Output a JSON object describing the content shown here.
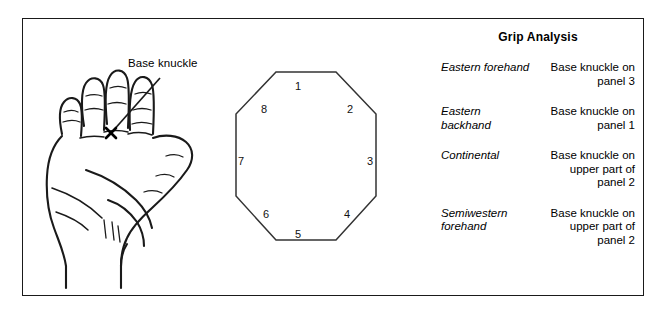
{
  "figure": {
    "hand": {
      "annotation_label": "Base knuckle",
      "marker": "x-marker"
    },
    "octagon": {
      "panels": [
        {
          "number": "1",
          "position": "top"
        },
        {
          "number": "2",
          "position": "top-right"
        },
        {
          "number": "3",
          "position": "right"
        },
        {
          "number": "4",
          "position": "bottom-right"
        },
        {
          "number": "5",
          "position": "bottom"
        },
        {
          "number": "6",
          "position": "bottom-left"
        },
        {
          "number": "7",
          "position": "left"
        },
        {
          "number": "8",
          "position": "top-left"
        }
      ]
    }
  },
  "grip_analysis": {
    "title": "Grip Analysis",
    "rows": [
      {
        "name": "Eastern forehand",
        "description": "Base knuckle on panel 3"
      },
      {
        "name": "Eastern backhand",
        "description": "Base knuckle on panel 1"
      },
      {
        "name": "Continental",
        "description": "Base knuckle on upper part of panel 2"
      },
      {
        "name": "Semiwestern forehand",
        "description": "Base knuckle on upper part of panel 2"
      }
    ]
  },
  "colors": {
    "ink": "#1a1a1a",
    "background": "#ffffff"
  }
}
